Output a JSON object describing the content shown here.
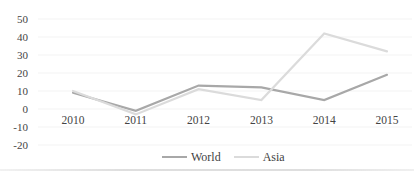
{
  "chart_data": {
    "type": "line",
    "categories": [
      "2010",
      "2011",
      "2012",
      "2013",
      "2014",
      "2015"
    ],
    "series": [
      {
        "name": "World",
        "values": [
          9,
          -1,
          13,
          12,
          5,
          19
        ],
        "color": "#a8a8a8"
      },
      {
        "name": "Asia",
        "values": [
          10,
          -3,
          11,
          5,
          42,
          32
        ],
        "color": "#dbdbdb"
      }
    ],
    "title": "",
    "xlabel": "",
    "ylabel": "",
    "ylim": [
      -20,
      50
    ],
    "yticks": [
      50,
      40,
      30,
      20,
      10,
      0,
      -10,
      -20
    ],
    "grid": true,
    "legend_position": "bottom-center"
  },
  "legend": {
    "items": [
      {
        "label": "World"
      },
      {
        "label": "Asia"
      }
    ]
  },
  "colors": {
    "world_line": "#a8a8a8",
    "asia_line": "#dbdbdb",
    "gridline": "#f3f3f3",
    "tick_text": "#444444",
    "legend_text": "#3f3f3f",
    "background": "#ffffff"
  }
}
